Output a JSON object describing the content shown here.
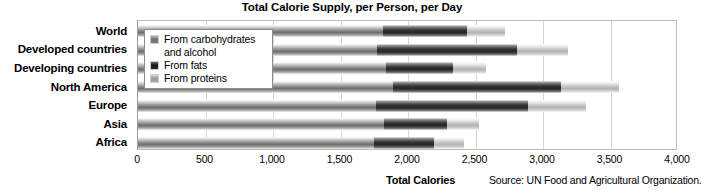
{
  "chart_data": {
    "type": "bar",
    "orientation": "horizontal",
    "stacked": true,
    "title": "Total Calorie Supply, per Person, per Day",
    "xlabel": "Total Calories",
    "ylabel": "",
    "xlim": [
      0,
      4000
    ],
    "xticks": [
      0,
      500,
      1000,
      1500,
      2000,
      2500,
      3000,
      3500,
      4000
    ],
    "xticklabels": [
      "0",
      "500",
      "1,000",
      "1,500",
      "2,000",
      "2,500",
      "3,000",
      "3,500",
      "4,000"
    ],
    "grid": true,
    "grid_axis": "x",
    "legend_position": "upper left (inside plot, overlapping bars)",
    "source": "Source: UN Food and Agricultural Organization.",
    "categories": [
      "World",
      "Developed countries",
      "Developing countries",
      "North America",
      "Europe",
      "Asia",
      "Africa"
    ],
    "series": [
      {
        "name": "From carbohydrates and alcohol",
        "color": "#6e6e6e",
        "values": [
          1815,
          1770,
          1835,
          1890,
          1760,
          1820,
          1750
        ]
      },
      {
        "name": "From fats",
        "color": "#232323",
        "values": [
          625,
          1040,
          495,
          1240,
          1130,
          470,
          440
        ]
      },
      {
        "name": "From proteins",
        "color": "#b2b2b2",
        "values": [
          275,
          375,
          245,
          430,
          430,
          235,
          225
        ]
      }
    ],
    "totals": [
      2715,
      3185,
      2575,
      3560,
      3320,
      2525,
      2415
    ]
  },
  "legend": {
    "items": [
      {
        "label": "From carbohydrates\nand alcohol",
        "swatch": "carb-swatch-icon"
      },
      {
        "label": "From fats",
        "swatch": "fat-swatch-icon"
      },
      {
        "label": "From proteins",
        "swatch": "protein-swatch-icon"
      }
    ]
  },
  "colors": {
    "carbohydrates": "#6e6e6e",
    "fats": "#232323",
    "proteins": "#b2b2b2",
    "gridline": "#d6d6d6",
    "axis": "#9a9a9a",
    "background": "#ffffff",
    "text": "#000000"
  }
}
